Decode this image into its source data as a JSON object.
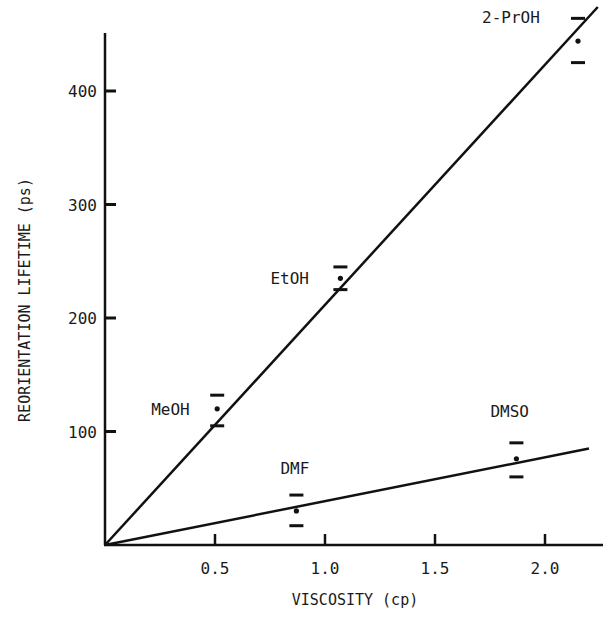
{
  "chart_data": {
    "type": "scatter",
    "title": "",
    "xlabel": "VISCOSITY (cp)",
    "ylabel": "REORIENTATION LIFETIME (ps)",
    "xlim": [
      0,
      2.2
    ],
    "ylim": [
      0,
      450
    ],
    "x_ticks": [
      0.5,
      1.0,
      1.5,
      2.0
    ],
    "x_tick_labels": [
      "0.5",
      "1.0",
      "1.5",
      "2.0"
    ],
    "y_ticks": [
      100,
      200,
      300,
      400
    ],
    "y_tick_labels": [
      "100",
      "200",
      "300",
      "400"
    ],
    "grid": false,
    "legend": null,
    "series": [
      {
        "name": "Alcohols",
        "points": [
          {
            "label": "MeOH",
            "x": 0.51,
            "y": 120,
            "err_high": 132,
            "err_low": 105
          },
          {
            "label": "EtOH",
            "x": 1.07,
            "y": 235,
            "err_high": 245,
            "err_low": 225
          },
          {
            "label": "2-PrOH",
            "x": 2.15,
            "y": 444,
            "err_high": 464,
            "err_low": 425
          }
        ],
        "fit_line": {
          "x": [
            0,
            2.24
          ],
          "y": [
            0,
            474
          ]
        }
      },
      {
        "name": "Aprotic solvents",
        "points": [
          {
            "label": "DMF",
            "x": 0.87,
            "y": 30,
            "err_high": 44,
            "err_low": 17
          },
          {
            "label": "DMSO",
            "x": 1.87,
            "y": 76,
            "err_high": 90,
            "err_low": 60
          }
        ],
        "fit_line": {
          "x": [
            0,
            2.2
          ],
          "y": [
            0,
            85
          ]
        }
      }
    ]
  }
}
